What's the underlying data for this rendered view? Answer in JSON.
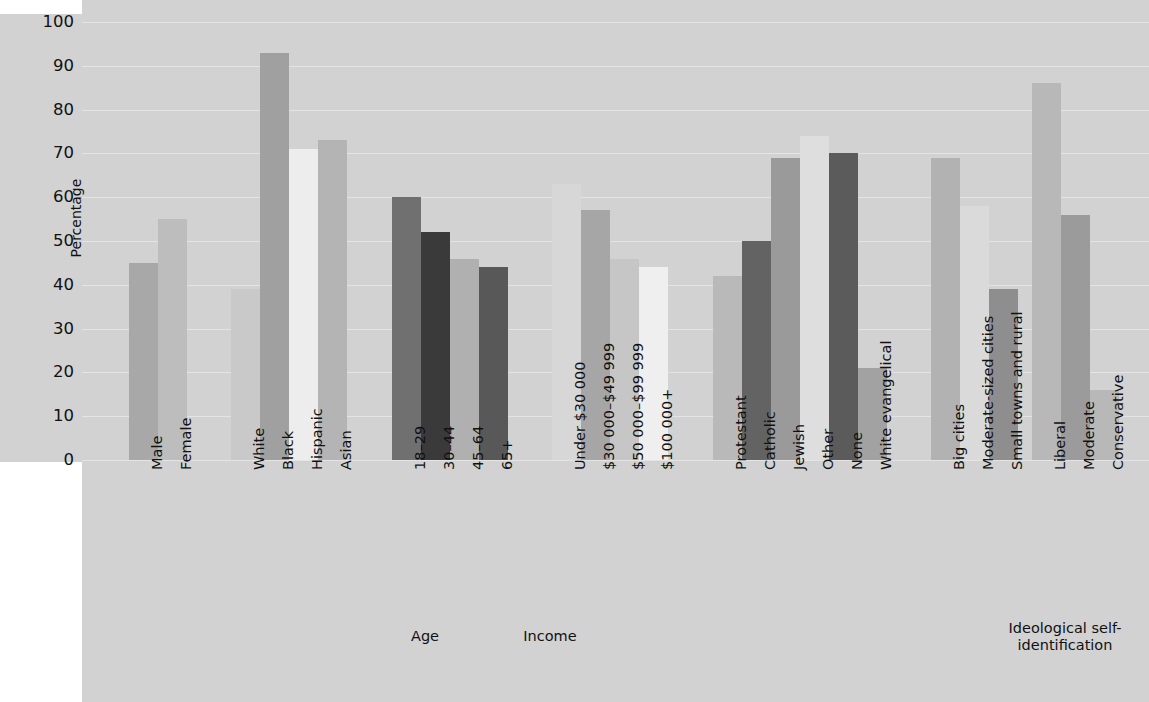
{
  "chart_data": {
    "type": "bar",
    "title": "",
    "xlabel": "",
    "ylabel": "Percentage",
    "ylim": [
      0,
      100
    ],
    "ytick_values": [
      0,
      10,
      20,
      30,
      40,
      50,
      60,
      70,
      80,
      90,
      100
    ],
    "ytick_labels": [
      "0",
      "10",
      "20",
      "30",
      "40",
      "50",
      "60",
      "70",
      "80",
      "90",
      "100"
    ],
    "grid": true,
    "legend": "none",
    "groups": [
      {
        "name": "",
        "categories": [
          "Male",
          "Female"
        ],
        "values": [
          45,
          55
        ],
        "colors": [
          "#a8a8a8",
          "#bdbdbd"
        ]
      },
      {
        "name": "",
        "categories": [
          "White",
          "Black",
          "Hispanic",
          "Asian"
        ],
        "values": [
          39,
          93,
          71,
          73
        ],
        "colors": [
          "#c9c9c9",
          "#a0a0a0",
          "#ededed",
          "#b4b4b4"
        ]
      },
      {
        "name": "Age",
        "categories": [
          "18–29",
          "30–44",
          "45–64",
          "65+"
        ],
        "values": [
          60,
          52,
          46,
          44
        ],
        "colors": [
          "#707070",
          "#3a3a3a",
          "#b0b0b0",
          "#585858"
        ]
      },
      {
        "name": "Income",
        "categories": [
          "Under $30 000",
          "$30 000–$49 999",
          "$50 000–$99 999",
          "$100 000+"
        ],
        "values": [
          63,
          57,
          46,
          44
        ],
        "colors": [
          "#d7d7d7",
          "#a6a6a6",
          "#c6c6c6",
          "#efefef"
        ]
      },
      {
        "name": "",
        "categories": [
          "Protestant",
          "Catholic",
          "Jewish",
          "Other",
          "None",
          "White evangelical"
        ],
        "values": [
          42,
          50,
          69,
          74,
          70,
          21
        ],
        "colors": [
          "#b9b9b9",
          "#636363",
          "#9a9a9a",
          "#dedede",
          "#5b5b5b",
          "#a2a2a2"
        ]
      },
      {
        "name": "",
        "categories": [
          "Big cities",
          "Moderate-sized cities",
          "Small towns and rural"
        ],
        "values": [
          69,
          58,
          39
        ],
        "colors": [
          "#b2b2b2",
          "#dadada",
          "#8e8e8e"
        ]
      },
      {
        "name": "Ideological self-identification",
        "categories": [
          "Liberal",
          "Moderate",
          "Conservative"
        ],
        "values": [
          86,
          56,
          16
        ],
        "colors": [
          "#b8b8b8",
          "#9b9b9b",
          "#b8b8b8"
        ]
      }
    ]
  },
  "axis": {
    "y_title": "Percentage",
    "ticks": [
      "100",
      "90",
      "80",
      "70",
      "60",
      "50",
      "40",
      "30",
      "20",
      "10",
      "0"
    ]
  },
  "bars": [
    {
      "label": "Male",
      "value": 45,
      "color": "#a8a8a8",
      "x": 129,
      "w": 29
    },
    {
      "label": "Female",
      "value": 55,
      "color": "#bdbdbd",
      "x": 158,
      "w": 29
    },
    {
      "label": "White",
      "value": 39,
      "color": "#c9c9c9",
      "x": 231,
      "w": 29
    },
    {
      "label": "Black",
      "value": 93,
      "color": "#a0a0a0",
      "x": 260,
      "w": 29
    },
    {
      "label": "Hispanic",
      "value": 71,
      "color": "#ededed",
      "x": 289,
      "w": 29
    },
    {
      "label": "Asian",
      "value": 73,
      "color": "#b4b4b4",
      "x": 318,
      "w": 29
    },
    {
      "label": "18–29",
      "value": 60,
      "color": "#707070",
      "x": 392,
      "w": 29
    },
    {
      "label": "30–44",
      "value": 52,
      "color": "#3a3a3a",
      "x": 421,
      "w": 29
    },
    {
      "label": "45–64",
      "value": 46,
      "color": "#b0b0b0",
      "x": 450,
      "w": 29
    },
    {
      "label": "65+",
      "value": 44,
      "color": "#585858",
      "x": 479,
      "w": 29
    },
    {
      "label": "Under $30 000",
      "value": 63,
      "color": "#d7d7d7",
      "x": 552,
      "w": 29
    },
    {
      "label": "$30 000–$49 999",
      "value": 57,
      "color": "#a6a6a6",
      "x": 581,
      "w": 29
    },
    {
      "label": "$50 000–$99 999",
      "value": 46,
      "color": "#c6c6c6",
      "x": 610,
      "w": 29
    },
    {
      "label": "$100 000+",
      "value": 44,
      "color": "#efefef",
      "x": 639,
      "w": 29
    },
    {
      "label": "Protestant",
      "value": 42,
      "color": "#b9b9b9",
      "x": 713,
      "w": 29
    },
    {
      "label": "Catholic",
      "value": 50,
      "color": "#636363",
      "x": 742,
      "w": 29
    },
    {
      "label": "Jewish",
      "value": 69,
      "color": "#9a9a9a",
      "x": 771,
      "w": 29
    },
    {
      "label": "Other",
      "value": 74,
      "color": "#dedede",
      "x": 800,
      "w": 29
    },
    {
      "label": "None",
      "value": 70,
      "color": "#5b5b5b",
      "x": 829,
      "w": 29
    },
    {
      "label": "White evangelical",
      "value": 21,
      "color": "#a2a2a2",
      "x": 858,
      "w": 29
    },
    {
      "label": "Big cities",
      "value": 69,
      "color": "#b2b2b2",
      "x": 931,
      "w": 29
    },
    {
      "label": "Moderate-sized cities",
      "value": 58,
      "color": "#dadada",
      "x": 960,
      "w": 29
    },
    {
      "label": "Small towns and rural",
      "value": 39,
      "color": "#8e8e8e",
      "x": 989,
      "w": 29
    },
    {
      "label": "Liberal",
      "value": 86,
      "color": "#b8b8b8",
      "x": 1032,
      "w": 29
    },
    {
      "label": "Moderate",
      "value": 56,
      "color": "#9b9b9b",
      "x": 1061,
      "w": 29
    },
    {
      "label": "Conservative",
      "value": 16,
      "color": "#b8b8b8",
      "x": 1090,
      "w": 29
    }
  ],
  "group_labels": [
    {
      "text": "Age",
      "x": 385,
      "y": 628,
      "w": 80
    },
    {
      "text": "Income",
      "x": 505,
      "y": 628,
      "w": 90
    },
    {
      "text": "Ideological self-identification",
      "x": 1000,
      "y": 620,
      "w": 130
    }
  ]
}
